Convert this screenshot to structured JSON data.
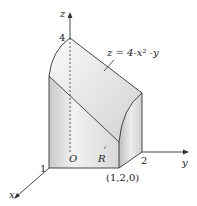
{
  "diagram": {
    "type": "3d-solid-region",
    "surface_label": "z = 4-x² -y",
    "axes": {
      "x": "x",
      "y": "y",
      "z": "z"
    },
    "labels": {
      "origin": "O",
      "region": "R",
      "z_intercept": "4",
      "x_tick": "1",
      "y_tick": "2",
      "corner_point": "(1,2,0)"
    },
    "colors": {
      "stroke": "#333333",
      "fill_light": "#f4f4f4",
      "fill_dark": "#c8c8c8"
    }
  }
}
